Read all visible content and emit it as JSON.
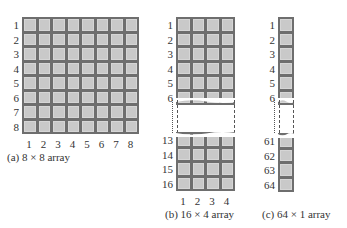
{
  "panels": [
    {
      "id": "a",
      "caption": "(a)  8 × 8 array",
      "rows": 8,
      "cols": 8,
      "row_labels": [
        "1",
        "2",
        "3",
        "4",
        "5",
        "6",
        "7",
        "8"
      ],
      "col_labels": [
        "1",
        "2",
        "3",
        "4",
        "5",
        "6",
        "7",
        "8"
      ]
    },
    {
      "id": "b",
      "caption": "(b)  16 × 4 array",
      "rows": 16,
      "cols": 4,
      "row_labels_top": [
        "1",
        "2",
        "3",
        "4",
        "5",
        "6"
      ],
      "row_labels_bottom": [
        "13",
        "14",
        "15",
        "16"
      ],
      "col_labels": [
        "1",
        "2",
        "3",
        "4"
      ],
      "break_between": [
        "6",
        "13"
      ]
    },
    {
      "id": "c",
      "caption": "(c)  64 × 1 array",
      "rows": 64,
      "cols": 1,
      "row_labels_top": [
        "1",
        "2",
        "3",
        "4",
        "5",
        "6"
      ],
      "row_labels_bottom": [
        "61",
        "62",
        "63",
        "64"
      ],
      "break_between": [
        "6",
        "61"
      ]
    }
  ],
  "colors": {
    "cell_fill": "#c9c9c9",
    "cell_border": "#6e6e6e",
    "label_text": "#333333"
  }
}
